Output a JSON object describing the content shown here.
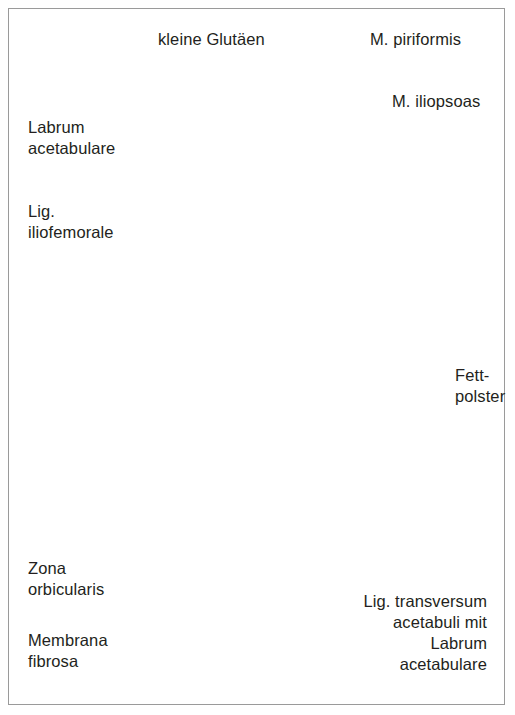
{
  "figure": {
    "language": "de",
    "border_color": "#9a9a9a",
    "background": "#ffffff"
  },
  "palette": {
    "text": "#231f20",
    "leader_line": "#6b6b6b",
    "bone_gray_light": "#e2e2e0",
    "bone_gray_mid": "#cfcfcb",
    "bone_gray_dark": "#b3b3ae",
    "cartilage_gray": "#d4d4d2",
    "femoral_head": "#dcdcda",
    "capsule_pink": "#f3d9d3",
    "capsule_pink_deep": "#e8bdb4",
    "hatch_salmon": "#d9958c",
    "zona_orbicularis": "#a85c55",
    "labrum_red": "#d8201c",
    "outline_dark_red": "#8c2220",
    "arrow_fill": "#c09a97",
    "dash_red": "#b42a26",
    "trabecula": "#555553"
  },
  "labels": [
    {
      "id": "kleine-glutaeen",
      "text": "kleine Glutäen",
      "lines": [
        "kleine Glutäen"
      ]
    },
    {
      "id": "m-piriformis",
      "text": "M. piriformis",
      "lines": [
        "M. piriformis"
      ]
    },
    {
      "id": "m-iliopsoas",
      "text": "M. iliopsoas",
      "lines": [
        "M. iliopsoas"
      ]
    },
    {
      "id": "labrum-acetabulare",
      "text": "Labrum acetabulare",
      "lines": [
        "Labrum",
        "acetabulare"
      ]
    },
    {
      "id": "lig-iliofemorale",
      "text": "Lig. iliofemorale",
      "lines": [
        "Lig.",
        "iliofemorale"
      ]
    },
    {
      "id": "fettpolster",
      "text": "Fett-polster",
      "lines": [
        "Fett-",
        "polster"
      ]
    },
    {
      "id": "zona-orbicularis",
      "text": "Zona orbicularis",
      "lines": [
        "Zona",
        "orbicularis"
      ]
    },
    {
      "id": "membrana-fibrosa",
      "text": "Membrana fibrosa",
      "lines": [
        "Membrana",
        "fibrosa"
      ]
    },
    {
      "id": "lig-transversum",
      "text": "Lig. transversum acetabuli mit Labrum acetabulare",
      "lines": [
        "Lig. transversum",
        "acetabuli mit",
        "Labrum",
        "acetabulare"
      ]
    }
  ],
  "label_text": {
    "kleine_glutaeen": "kleine Glutäen",
    "m_piriformis": "M. piriformis",
    "m_iliopsoas": "M. iliopsoas",
    "labrum_1": "Labrum",
    "labrum_2": "acetabulare",
    "lig_ilio_1": "Lig.",
    "lig_ilio_2": "iliofemorale",
    "fett_1": "Fett-",
    "fett_2": "polster",
    "zona_1": "Zona",
    "zona_2": "orbicularis",
    "membrana_1": "Membrana",
    "membrana_2": "fibrosa",
    "transv_1": "Lig. transversum",
    "transv_2": "acetabuli mit",
    "transv_3": "Labrum",
    "transv_4": "acetabulare"
  },
  "structures": [
    {
      "name": "os-coxae-spongiosa",
      "description": "pelvic bone with trabecular speckle"
    },
    {
      "name": "femoral-head",
      "description": "caput femoris, smooth gray dome"
    },
    {
      "name": "greater-trochanter",
      "description": "trochanter major, gray"
    },
    {
      "name": "femur-shaft",
      "description": "femoral diaphysis, gray"
    },
    {
      "name": "joint-capsule",
      "description": "pink fibrous capsule with fibre striations"
    },
    {
      "name": "zona-orbicularis-band",
      "description": "dark maroon circular band"
    },
    {
      "name": "labrum-wedge-superior",
      "description": "bright red triangular labrum"
    },
    {
      "name": "labrum-wedge-inferior",
      "description": "bright red transverse ligament wedge"
    },
    {
      "name": "muscle-arrow",
      "description": "large rosy arrow of muscle pull direction"
    },
    {
      "name": "muscle-band-iliofemorale",
      "description": "hatched salmon band"
    },
    {
      "name": "fat-pad",
      "description": "pulvinar / fett-polster gray region"
    }
  ]
}
